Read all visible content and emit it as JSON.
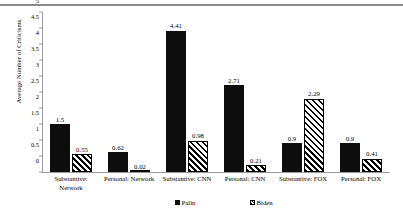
{
  "chart_data": {
    "type": "bar",
    "title": "",
    "xlabel": "",
    "ylabel": "Average Number of Criticisms",
    "ylim": [
      0,
      5
    ],
    "yticks": [
      "0",
      "0.5",
      "1",
      "1.5",
      "2",
      "2.5",
      "3",
      "3.5",
      "4",
      "4.5",
      "5"
    ],
    "grid": false,
    "legend_position": "bottom",
    "categories": [
      "Substantive:\nNetwork",
      "Personal: Network",
      "Substantive: CNN",
      "Personal: CNN",
      "Substantive: FOX",
      "Personal: FOX"
    ],
    "series": [
      {
        "name": "Palin",
        "values": [
          1.5,
          0.62,
          4.41,
          2.71,
          0.9,
          0.9
        ],
        "labels": [
          "1.5",
          "0.62",
          "4.41",
          "2.71",
          "0.9",
          "0.9"
        ],
        "fill": "solid-black",
        "color": "#0d0d0d"
      },
      {
        "name": "Biden",
        "values": [
          0.55,
          0.02,
          0.98,
          0.21,
          2.29,
          0.41
        ],
        "labels": [
          "0.55",
          "0.02",
          "0.98",
          "0.21",
          "2.29",
          "0.41"
        ],
        "fill": "diagonal-hatch",
        "color": "#000000"
      }
    ]
  },
  "legend": {
    "items": [
      {
        "label": "Palin",
        "marker": "solid-square-icon"
      },
      {
        "label": "Biden",
        "marker": "hatched-square-icon"
      }
    ]
  }
}
